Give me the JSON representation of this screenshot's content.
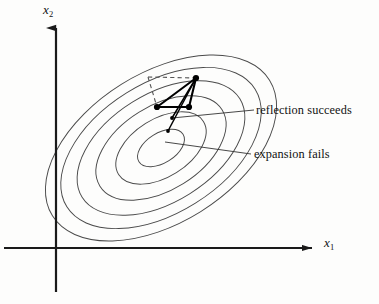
{
  "figure": {
    "axes": {
      "x_label": "x",
      "x_subscript": "1",
      "y_label": "x",
      "y_subscript": "2"
    },
    "annotations": {
      "reflection": "reflection succeeds",
      "expansion": "expansion fails"
    },
    "colors": {
      "axis": "#1a1a1a",
      "contour": "#4a4a4a",
      "simplex": "#000000",
      "dashed": "#555555",
      "leader": "#333333",
      "background": "#fdfdfc",
      "text": "#111111"
    }
  },
  "chart_data": {
    "type": "line",
    "xlabel": "x1",
    "ylabel": "x2",
    "grid": false,
    "legend": null,
    "axis_origin_px": [
      56,
      248
    ],
    "x_axis_end_px": [
      322,
      248
    ],
    "y_axis_end_px": [
      56,
      18
    ],
    "contours": {
      "kind": "concentric_ellipses",
      "count": 6,
      "center_px": [
        161,
        148
      ],
      "rotation_deg": -32,
      "semi_axes_px": [
        [
          26,
          15
        ],
        [
          50,
          29
        ],
        [
          72,
          42
        ],
        [
          93,
          54
        ],
        [
          111,
          65
        ],
        [
          128,
          75
        ]
      ]
    },
    "simplex_vertices_px": [
      [
        196,
        78
      ],
      [
        157,
        107
      ],
      [
        189,
        107
      ]
    ],
    "simplex_edges": [
      [
        0,
        1
      ],
      [
        1,
        2
      ],
      [
        2,
        0
      ]
    ],
    "interior_segments_px": [
      [
        [
          196,
          78
        ],
        [
          172,
          118
        ]
      ],
      [
        [
          196,
          78
        ],
        [
          168,
          131
        ]
      ]
    ],
    "small_points_px": [
      [
        172,
        118
      ],
      [
        168,
        131
      ]
    ],
    "dashed_construction_px": [
      [
        [
          148,
          77
        ],
        [
          196,
          78
        ]
      ],
      [
        [
          148,
          77
        ],
        [
          157,
          107
        ]
      ]
    ],
    "leader_lines_px": [
      [
        [
          172,
          118
        ],
        [
          254,
          110
        ]
      ],
      [
        [
          165,
          142
        ],
        [
          251,
          154
        ]
      ]
    ],
    "annotations": [
      {
        "text": "reflection succeeds",
        "anchor_px": [
          256,
          103
        ]
      },
      {
        "text": "expansion fails",
        "anchor_px": [
          254,
          147
        ]
      }
    ]
  }
}
